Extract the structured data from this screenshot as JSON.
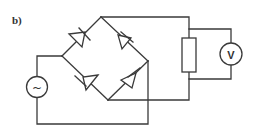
{
  "diagram": {
    "label": "b)",
    "components": {
      "ac_source": {
        "symbol": "~",
        "type": "AC voltage source"
      },
      "voltmeter": {
        "symbol": "V",
        "type": "Voltmeter"
      },
      "resistor": {
        "type": "Load resistor"
      },
      "diodes": [
        {
          "position": "upper-left",
          "type": "diode"
        },
        {
          "position": "upper-right",
          "type": "diode"
        },
        {
          "position": "lower-left",
          "type": "diode"
        },
        {
          "position": "lower-right",
          "type": "diode"
        }
      ]
    },
    "colors": {
      "line": "#3a3a3a",
      "background": "#ffffff"
    }
  }
}
